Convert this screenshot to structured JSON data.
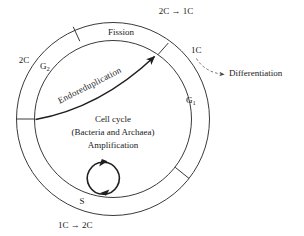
{
  "figure": {
    "name": "cell-cycle-diagram",
    "center_text_lines": [
      "Cell cycle",
      "(Bacteria and Archaea)",
      "Amplification"
    ],
    "ring_segments": [
      {
        "id": "g2",
        "label": "G",
        "sub": "2"
      },
      {
        "id": "fission",
        "label": "Fission",
        "sub": ""
      },
      {
        "id": "g1",
        "label": "G",
        "sub": "1"
      }
    ],
    "outer_labels": {
      "top": "2C → 1C",
      "left": "2C",
      "right": "1C",
      "bottom": "1C → 2C",
      "differentiation": "Differentiation"
    },
    "inner_labels": {
      "endoreduplication": "Endoreduplication",
      "s_phase": "S"
    },
    "colors": {
      "line": "#3a3a3a",
      "bold_line": "#1f1f1f",
      "text": "#1a1a1a",
      "background": "#ffffff"
    }
  }
}
